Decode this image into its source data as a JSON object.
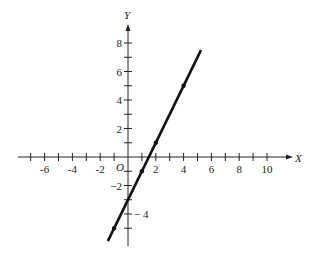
{
  "chart_data": {
    "type": "line",
    "title": "",
    "xlabel": "X",
    "ylabel": "Y",
    "origin_label": "O",
    "xlim": [
      -7.5,
      11.5
    ],
    "ylim": [
      -6.2,
      9.5
    ],
    "grid": false,
    "x_tick_labels": [
      "-6",
      "-4",
      "-2",
      "2",
      "4",
      "6",
      "8",
      "10"
    ],
    "x_tick_values": [
      -6,
      -4,
      -2,
      2,
      4,
      6,
      8,
      10
    ],
    "x_minor_ticks": [
      -7,
      -6,
      -5,
      -4,
      -3,
      -2,
      -1,
      1,
      2,
      3,
      4,
      5,
      6,
      7,
      8,
      9,
      10
    ],
    "y_tick_labels": [
      "8",
      "6",
      "4",
      "2",
      "-2",
      "-4"
    ],
    "y_tick_values": [
      8,
      6,
      4,
      2,
      -2,
      -4
    ],
    "y_minor_ticks": [
      8,
      7,
      6,
      5,
      4,
      3,
      2,
      1,
      -1,
      -2,
      -3,
      -4,
      -5
    ],
    "series": [
      {
        "name": "y = 2x - 3",
        "line_x": [
          -1.45,
          5.25
        ],
        "line_y": [
          -5.9,
          7.5
        ],
        "points_x": [
          -1,
          1,
          2,
          4
        ],
        "points_y": [
          -5,
          -1,
          1,
          5
        ],
        "color": "#111111"
      }
    ]
  }
}
